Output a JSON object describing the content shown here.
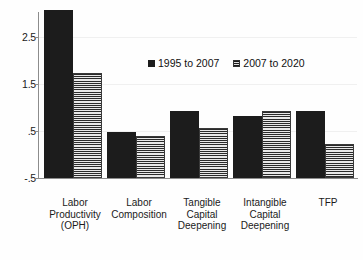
{
  "chart_data": {
    "type": "bar",
    "title": "",
    "subtitle": "",
    "xlabel": "",
    "ylabel": "",
    "grid": true,
    "legend_position": "top-center",
    "ylim": [
      -0.5,
      3.0
    ],
    "yticks": [
      -0.5,
      0.5,
      1.5,
      2.5
    ],
    "ytick_labels": [
      "-.5",
      ".5",
      "1.5",
      "2.5"
    ],
    "categories": [
      "Labor Productivity (OPH)",
      "Labor Composition",
      "Tangible Capital Deepening",
      "Intangible Capital Deepening",
      "TFP"
    ],
    "category_lines": [
      [
        "Labor",
        "Productivity",
        "(OPH)"
      ],
      [
        "Labor",
        "Composition"
      ],
      [
        "Tangible",
        "Capital",
        "Deepening"
      ],
      [
        "Intangible",
        "Capital",
        "Deepening"
      ],
      [
        "TFP"
      ]
    ],
    "series": [
      {
        "name": "1995 to 2007",
        "color": "#1c1c1c",
        "pattern": "solid",
        "values": [
          2.99,
          0.45,
          0.9,
          0.79,
          0.89
        ]
      },
      {
        "name": "2007 to 2020",
        "color": "#5a5a5a",
        "pattern": "horizontal-hatch",
        "values": [
          1.68,
          0.38,
          0.54,
          0.9,
          0.21
        ]
      }
    ]
  },
  "legend": {
    "entries": [
      {
        "label": "1995 to 2007",
        "swatch": "solid-dark-swatch"
      },
      {
        "label": "2007 to 2020",
        "swatch": "hatched-gray-swatch"
      }
    ]
  }
}
